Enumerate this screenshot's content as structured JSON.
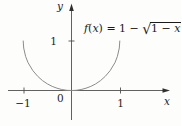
{
  "figure": {
    "y_axis_label": "y",
    "x_axis_label": "x",
    "origin_label": "0",
    "y_tick_label": "1",
    "x_tick_labels": [
      "−1",
      "1"
    ],
    "colors": {
      "curve": "#8c8c8c",
      "axis": "#4f4f4f",
      "arrow": "#2f2f2f",
      "text": "#1e1e1e",
      "background": "#fdfdfc"
    }
  },
  "formula": {
    "f": "f",
    "open_paren": "(",
    "variable": "x",
    "equals_part": ") = 1 − ",
    "radical_sign": "√",
    "radicand_prefix": "1 − ",
    "radicand_variable": "x",
    "exponent": "2"
  },
  "chart_data": {
    "type": "line",
    "xlabel": "x",
    "ylabel": "y",
    "xlim": [
      -1.35,
      2.1
    ],
    "ylim": [
      -0.65,
      1.8
    ],
    "x_ticks": [
      -1,
      0,
      1
    ],
    "y_ticks": [
      1
    ],
    "grid": false,
    "legend": false,
    "series": [
      {
        "name": "f(x) = 1 − √(1 − x²)",
        "x": [
          -1,
          -0.99,
          -0.95,
          -0.9,
          -0.8,
          -0.7,
          -0.6,
          -0.5,
          -0.4,
          -0.3,
          -0.2,
          -0.1,
          0,
          0.1,
          0.2,
          0.3,
          0.4,
          0.5,
          0.6,
          0.7,
          0.8,
          0.9,
          0.95,
          0.99,
          1
        ],
        "y": [
          1,
          0.859,
          0.688,
          0.564,
          0.4,
          0.286,
          0.2,
          0.134,
          0.083,
          0.046,
          0.02,
          0.005,
          0,
          0.005,
          0.02,
          0.046,
          0.083,
          0.134,
          0.2,
          0.286,
          0.4,
          0.564,
          0.688,
          0.859,
          1
        ]
      }
    ]
  }
}
